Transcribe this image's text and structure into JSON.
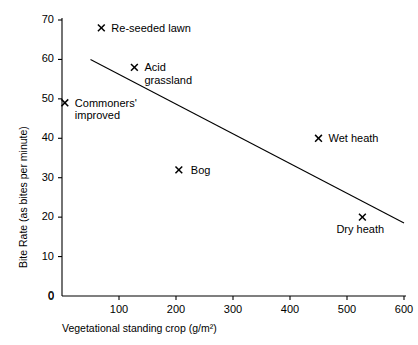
{
  "chart_data": {
    "type": "scatter",
    "title": "",
    "xlabel": "Vegetational standing crop (g/m²)",
    "ylabel": "Bite Rate (as bites per minute)",
    "xlim": [
      0,
      600
    ],
    "ylim": [
      0,
      70
    ],
    "xticks": [
      0,
      100,
      200,
      300,
      400,
      500,
      600
    ],
    "yticks": [
      0,
      10,
      20,
      30,
      40,
      50,
      60,
      70
    ],
    "grid": false,
    "legend": "none",
    "marker": "x",
    "points": [
      {
        "label": "Re-seeded lawn",
        "x": 69,
        "y": 68,
        "label_dx": 10,
        "label_dy": -6,
        "lines": [
          "Re-seeded lawn"
        ]
      },
      {
        "label": "Acid grassland",
        "x": 127,
        "y": 58,
        "label_dx": 10,
        "label_dy": -6,
        "lines": [
          "Acid",
          "grassland"
        ]
      },
      {
        "label": "Commoners' improved",
        "x": 5,
        "y": 49,
        "label_dx": 10,
        "label_dy": -6,
        "lines": [
          "Commoners'",
          "improved"
        ]
      },
      {
        "label": "Wet heath",
        "x": 450,
        "y": 40,
        "label_dx": 10,
        "label_dy": -6,
        "lines": [
          "Wet heath"
        ]
      },
      {
        "label": "Bog",
        "x": 205,
        "y": 32,
        "label_dx": 12,
        "label_dy": -6,
        "lines": [
          "Bog"
        ]
      },
      {
        "label": "Dry heath",
        "x": 527,
        "y": 20,
        "label_dx": -26,
        "label_dy": 6,
        "lines": [
          "Dry heath"
        ]
      }
    ],
    "trend_line": {
      "x_start": 50,
      "y_start": 60,
      "x_end": 600,
      "y_end": 18.5
    },
    "colors": {
      "axis": "#000000",
      "line": "#000000",
      "marker": "#000000",
      "text": "#000000",
      "background": "#ffffff"
    }
  }
}
